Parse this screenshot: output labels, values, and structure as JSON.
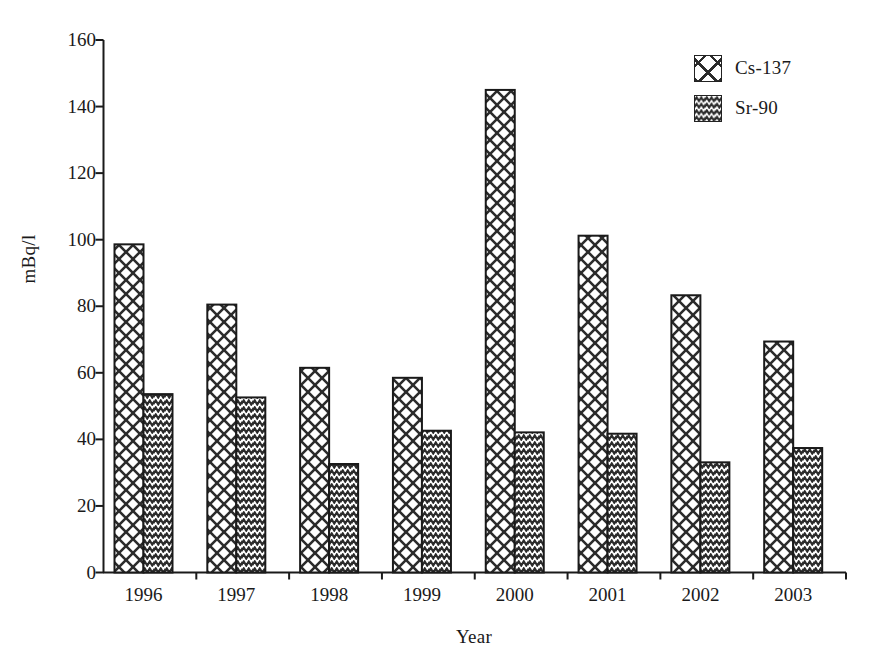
{
  "chart_data": {
    "type": "bar",
    "title": "",
    "subtitle": "",
    "xlabel": "Year",
    "ylabel": "mBq/l",
    "categories": [
      "1996",
      "1997",
      "1998",
      "1999",
      "2000",
      "2001",
      "2002",
      "2003"
    ],
    "series": [
      {
        "name": "Cs-137",
        "pattern": "basketweave-crosshatch",
        "values": [
          98.6,
          80.5,
          61.5,
          58.5,
          145.0,
          101.2,
          83.3,
          69.4
        ]
      },
      {
        "name": "Sr-90",
        "pattern": "zigzag-wave",
        "values": [
          53.6,
          52.6,
          32.6,
          42.6,
          42.1,
          41.7,
          33.1,
          37.4
        ]
      }
    ],
    "ylim": [
      0,
      160
    ],
    "yticks": [
      0,
      20,
      40,
      60,
      80,
      100,
      120,
      140,
      160
    ],
    "ytick_labels": [
      "0",
      "20",
      "40",
      "60",
      "80",
      "100",
      "120",
      "140",
      "160"
    ],
    "grid": false,
    "legend_position": "top-right",
    "legend_entries": [
      "Cs-137",
      "Sr-90"
    ],
    "colors": {
      "axis": "#1a1a1a",
      "bar_outline": "#1a1a1a",
      "bar_fill": "#ffffff",
      "pattern": "#333333",
      "background": "#ffffff"
    }
  }
}
